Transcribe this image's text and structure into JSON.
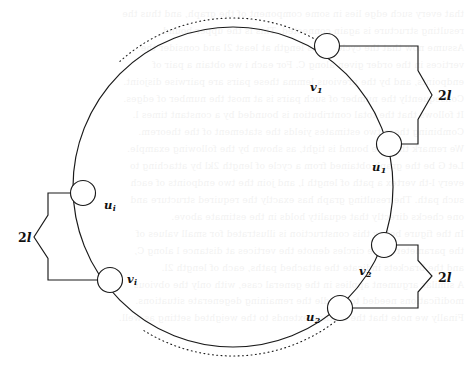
{
  "figure": {
    "kind": "cycle-graph-diagram",
    "width": 471,
    "height": 369,
    "background_color": "#ffffff",
    "ink_color": "#1a1a1a"
  },
  "main_cycle": {
    "name": "main-cycle-circle",
    "center_x": 233,
    "center_y": 187,
    "radius": 160,
    "stroke_width": 1.2
  },
  "vertices": [
    {
      "id": "v1",
      "label": "v",
      "subscript": "1",
      "cx": 327,
      "cy": 46,
      "r": 12.5,
      "label_x": 310,
      "label_y": 80
    },
    {
      "id": "u1",
      "label": "u",
      "subscript": "1",
      "cx": 389,
      "cy": 144,
      "r": 12.5,
      "label_x": 372,
      "label_y": 160
    },
    {
      "id": "v2",
      "label": "v",
      "subscript": "2",
      "cx": 384,
      "cy": 245,
      "r": 12.5,
      "label_x": 359,
      "label_y": 264
    },
    {
      "id": "u2",
      "label": "u",
      "subscript": "2",
      "cx": 340,
      "cy": 308,
      "r": 12.5,
      "label_x": 306,
      "label_y": 310
    },
    {
      "id": "vi",
      "label": "v",
      "subscript": "i",
      "cx": 110,
      "cy": 280,
      "r": 12.5,
      "label_x": 127,
      "label_y": 272
    },
    {
      "id": "ui",
      "label": "u",
      "subscript": "i",
      "cx": 83,
      "cy": 193,
      "r": 12.5,
      "label_x": 104,
      "label_y": 198
    }
  ],
  "brackets": [
    {
      "id": "bracket-right-top",
      "label": "2l",
      "label_number": "2",
      "label_variable": "l",
      "orientation": "right",
      "from_vertex": "v1",
      "from_x": 327,
      "from_y": 46,
      "to_vertex": "u1",
      "to_x": 389,
      "to_y": 144,
      "spine_x": 418,
      "notch_x": 432,
      "notch_y": 95,
      "label_x": 438,
      "label_y": 88
    },
    {
      "id": "bracket-right-bottom",
      "label": "2l",
      "label_number": "2",
      "label_variable": "l",
      "orientation": "right",
      "from_vertex": "v2",
      "from_x": 384,
      "from_y": 245,
      "to_vertex": "u2",
      "to_x": 340,
      "to_y": 308,
      "spine_x": 418,
      "notch_x": 432,
      "notch_y": 276,
      "label_x": 438,
      "label_y": 270
    },
    {
      "id": "bracket-left",
      "label": "2l",
      "label_number": "2",
      "label_variable": "l",
      "orientation": "left",
      "from_vertex": "ui",
      "from_x": 83,
      "from_y": 193,
      "to_vertex": "vi",
      "to_x": 110,
      "to_y": 280,
      "spine_x": 48,
      "notch_x": 34,
      "notch_y": 237,
      "label_x": 18,
      "label_y": 230
    }
  ],
  "dotted_arcs": [
    {
      "id": "dotted-arc-top",
      "description": "dotted arc outside the circle spanning the top between v1 and the upper-left region",
      "start_angle_deg": -132,
      "end_angle_deg": -54,
      "radius_offset": 9
    },
    {
      "id": "dotted-arc-bottom",
      "description": "dotted arc outside the circle spanning the bottom between vi and u2",
      "start_angle_deg": 50,
      "end_angle_deg": 122,
      "radius_offset": 9
    }
  ],
  "background_bleed_text": {
    "description": "faint show-through text from the reverse side of the scanned page",
    "lines": [
      "that every such edge lies in some component of the graph, and thus the",
      "resulting structure is again connected. This is the upper bound.",
      "Assume now that the cycle C has length at least 2l and consider the",
      "vertices in the order given along C. For each i we obtain a pair of",
      "endpoints, and by the previous lemma these pairs are pairwise disjoint.",
      "Consequently the number of such pairs is at most the number of edges.",
      "It follows that the total contribution is bounded by a constant times l.",
      "Combining these two estimates yields the statement of the theorem.",
      "We remark that the bound is tight, as shown by the following example.",
      "Let G be the graph obtained from a cycle of length 2kl by attaching to",
      "every l-th vertex a path of length l, and join the two endpoints of each",
      "such path. The resulting graph has exactly the required structure and",
      "one checks directly that equality holds in the estimate above.",
      "In the figure below this construction is illustrated for small values of",
      "the parameters. The circles denote the vertices at distance l along C,",
      "and the brackets indicate the attached paths, each of length 2l.",
      "A similar argument applies in the general case, with only the obvious",
      "modifications needed to handle the remaining degenerate situations.",
      "Finally we note that the method extends to the weighted setting as well."
    ]
  }
}
